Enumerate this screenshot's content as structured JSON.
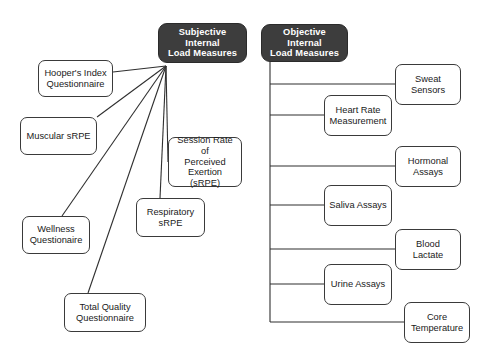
{
  "diagram": {
    "title": "Internal Load Measures",
    "canvas": {
      "width": 490,
      "height": 359
    },
    "colors": {
      "root_fill": "#3d3d3d",
      "root_text": "#ffffff",
      "leaf_fill": "#ffffff",
      "leaf_border": "#3a3a3a",
      "leaf_text": "#1a1a1a",
      "connector": "#2f2f2f",
      "background": "#ffffff"
    },
    "roots": [
      {
        "id": "subjective",
        "label": "Subjective Internal Load Measures",
        "line1": "Subjective Internal",
        "line2": "Load Measures",
        "x": 158,
        "y": 23,
        "w": 89,
        "h": 40
      },
      {
        "id": "objective",
        "label": "Objective Internal Load Measures",
        "line1": "Objective Internal",
        "line2": "Load Measures",
        "x": 261,
        "y": 24,
        "w": 87,
        "h": 38
      }
    ],
    "subjective_children": [
      {
        "id": "hoopers-index",
        "label": "Hooper's Index Questionnaire",
        "line1": "Hooper's Index",
        "line2": "Questionnaire",
        "x": 38,
        "y": 60,
        "w": 75,
        "h": 37
      },
      {
        "id": "muscular-srpe",
        "label": "Muscular sRPE",
        "line1": "Muscular sRPE",
        "line2": "",
        "x": 20,
        "y": 117,
        "w": 77,
        "h": 38
      },
      {
        "id": "session-rpe",
        "label": "Session Rate of Perceived Exertion (sRPE)",
        "line1": "Session Rate of",
        "line2": "Perceived",
        "line3": "Exertion (sRPE)",
        "x": 168,
        "y": 137,
        "w": 74,
        "h": 50
      },
      {
        "id": "respiratory-srpe",
        "label": "Respiratory sRPE",
        "line1": "Respiratory",
        "line2": "sRPE",
        "x": 136,
        "y": 198,
        "w": 69,
        "h": 39
      },
      {
        "id": "wellness-questionaire",
        "label": "Wellness Questionaire",
        "line1": "Wellness",
        "line2": "Questionaire",
        "x": 22,
        "y": 216,
        "w": 68,
        "h": 38
      },
      {
        "id": "total-quality-questionnaire",
        "label": "Total Quality Questionnaire",
        "line1": "Total Quality",
        "line2": "Questionnaire",
        "x": 64,
        "y": 293,
        "w": 82,
        "h": 39
      }
    ],
    "objective_children": [
      {
        "id": "sweat-sensors",
        "label": "Sweat Sensors",
        "line1": "Sweat Sensors",
        "line2": "",
        "x": 395,
        "y": 64,
        "w": 66,
        "h": 41,
        "branch_y": 84
      },
      {
        "id": "heart-rate-measurement",
        "label": "Heart Rate Measurement",
        "line1": "Heart Rate",
        "line2": "Measurement",
        "x": 324,
        "y": 95,
        "w": 68,
        "h": 41,
        "branch_y": 115
      },
      {
        "id": "hormonal-assays",
        "label": "Hormonal Assays",
        "line1": "Hormonal",
        "line2": "Assays",
        "x": 395,
        "y": 146,
        "w": 66,
        "h": 41,
        "branch_y": 166
      },
      {
        "id": "saliva-assays",
        "label": "Saliva Assays",
        "line1": "Saliva Assays",
        "line2": "",
        "x": 324,
        "y": 185,
        "w": 68,
        "h": 41,
        "branch_y": 205
      },
      {
        "id": "blood-lactate",
        "label": "Blood Lactate",
        "line1": "Blood Lactate",
        "line2": "",
        "x": 395,
        "y": 229,
        "w": 66,
        "h": 41,
        "branch_y": 249
      },
      {
        "id": "urine-assays",
        "label": "Urine Assays",
        "line1": "Urine Assays",
        "line2": "",
        "x": 324,
        "y": 264,
        "w": 68,
        "h": 41,
        "branch_y": 284
      },
      {
        "id": "core-temperature",
        "label": "Core Temperature",
        "line1": "Core",
        "line2": "Temperature",
        "x": 404,
        "y": 302,
        "w": 66,
        "h": 41,
        "branch_y": 322
      }
    ],
    "subjective_fan": {
      "origin_x": 166,
      "origin_y": 66,
      "targets": [
        {
          "id": "hoopers-index",
          "x": 113,
          "y": 72
        },
        {
          "id": "muscular-srpe",
          "x": 97,
          "y": 117
        },
        {
          "id": "session-rpe",
          "x": 168,
          "y": 162
        },
        {
          "id": "respiratory-srpe",
          "x": 160,
          "y": 198
        },
        {
          "id": "wellness-questionaire",
          "x": 62,
          "y": 216
        },
        {
          "id": "total-quality-questionnaire",
          "x": 88,
          "y": 293
        }
      ]
    },
    "objective_trunk": {
      "x": 270,
      "top_y": 62,
      "bottom_y": 322
    }
  }
}
